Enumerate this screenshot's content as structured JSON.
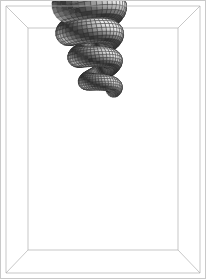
{
  "figure": {
    "type": "surface3d",
    "width": 206,
    "height": 279,
    "background_color": "#ffffff",
    "border_color": "#c9c9c9"
  },
  "bounding_box": {
    "name": "wireframe-bounding-box",
    "stroke_color": "#b0b0b0",
    "stroke_width": 0.7,
    "front_face": {
      "x0": 6,
      "y0": 6,
      "x1": 200,
      "y1": 273
    },
    "back_face": {
      "x0": 28,
      "y0": 28,
      "x1": 178,
      "y1": 250
    },
    "visible_edges": [
      "front-rect",
      "back-rect",
      "corner-diagonal-top-left",
      "corner-diagonal-top-right",
      "corner-diagonal-bottom-left",
      "corner-diagonal-bottom-right"
    ]
  },
  "chart_data": {
    "type": "surface3d",
    "xlabel": "",
    "ylabel": "",
    "zlabel": "",
    "grid": true,
    "legend": null,
    "surface": {
      "name": "seashell-surface",
      "parametrization": "helical tube with exponentially growing radius",
      "coils": 3.45,
      "u_start_turns": 0.0,
      "u_end_turns": 3.45,
      "u_steps": 150,
      "v_steps": 20,
      "growth_rate": 0.228,
      "base_tube_radius": 7.5,
      "base_helix_radius": 11.0,
      "vertical_pitch": -26.0,
      "center_x": 103,
      "center_y": 92,
      "tilt_deg": -11.0,
      "y_squash": 0.52,
      "aperture_visible": true
    },
    "shading": {
      "model": "lambert-diffuse",
      "light_direction": [
        0.62,
        -0.34,
        0.71
      ],
      "ambient": 0.14,
      "color_dark": "#101010",
      "color_mid": "#6e6e6e",
      "color_light": "#e8e8e8",
      "mesh_line_color": "#2a2a2a",
      "mesh_line_width": 0.35,
      "inner_surface_tint": 1.22
    },
    "coil_summary": [
      {
        "index": 1,
        "label": "apex coil",
        "approx_center": [
          113,
          33
        ],
        "approx_tube_radius": 9,
        "mean_gray": "#555555"
      },
      {
        "index": 2,
        "label": "second coil",
        "approx_center": [
          100,
          66
        ],
        "approx_tube_radius": 17,
        "mean_gray": "#6a6a6a"
      },
      {
        "index": 3,
        "label": "third coil",
        "approx_center": [
          104,
          123
        ],
        "approx_tube_radius": 30,
        "mean_gray": "#747474"
      },
      {
        "index": 4,
        "label": "body whorl",
        "approx_center": [
          100,
          195
        ],
        "approx_tube_radius": 48,
        "mean_gray": "#9a9a9a"
      }
    ],
    "aperture": {
      "label": "shell aperture (open end)",
      "center": [
        108,
        205
      ],
      "radius_x": 62,
      "radius_y": 70,
      "fill_gray": "#bdbdbd"
    }
  }
}
